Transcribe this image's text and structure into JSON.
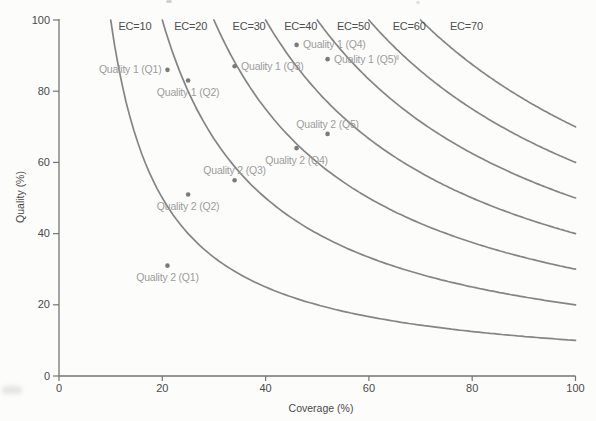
{
  "chart_data": {
    "type": "scatter",
    "title": "",
    "xlabel": "Coverage (%)",
    "ylabel": "Quality (%)",
    "xlim": [
      0,
      100
    ],
    "ylim": [
      0,
      100
    ],
    "x_ticks": [
      0,
      20,
      40,
      60,
      80,
      100
    ],
    "y_ticks": [
      0,
      20,
      40,
      60,
      80,
      100
    ],
    "grid": false,
    "legend": "none",
    "iso_curves": {
      "formula": "EC = Coverage * Quality / 100",
      "curves": [
        {
          "ec": 10,
          "label": "EC=10",
          "label_x": 11.5
        },
        {
          "ec": 20,
          "label": "EC=20",
          "label_x": 22.3
        },
        {
          "ec": 30,
          "label": "EC=30",
          "label_x": 33.6
        },
        {
          "ec": 40,
          "label": "EC=40",
          "label_x": 43.6
        },
        {
          "ec": 50,
          "label": "EC=50",
          "label_x": 53.8
        },
        {
          "ec": 60,
          "label": "EC=60",
          "label_x": 64.6
        },
        {
          "ec": 70,
          "label": "EC=70",
          "label_x": 75.7
        }
      ]
    },
    "series": [
      {
        "name": "Quality 1",
        "points": [
          {
            "label": "Quality 1 (Q1)",
            "x": 21,
            "y": 86,
            "label_anchor": "left"
          },
          {
            "label": "Quality 1 (Q2)",
            "x": 25,
            "y": 83,
            "label_anchor": "below"
          },
          {
            "label": "Quality 1 (Q3)",
            "x": 34,
            "y": 87,
            "label_anchor": "right"
          },
          {
            "label": "Quality 1 (Q4)",
            "x": 46,
            "y": 93,
            "label_anchor": "right"
          },
          {
            "label": "Quality 1 (Q5)",
            "x": 52,
            "y": 89,
            "label_anchor": "right"
          }
        ]
      },
      {
        "name": "Quality 2",
        "points": [
          {
            "label": "Quality 2 (Q1)",
            "x": 21,
            "y": 31,
            "label_anchor": "below"
          },
          {
            "label": "Quality 2 (Q2)",
            "x": 25,
            "y": 51,
            "label_anchor": "below"
          },
          {
            "label": "Quality 2 (Q3)",
            "x": 34,
            "y": 55,
            "label_anchor": "above"
          },
          {
            "label": "Quality 2 (Q4)",
            "x": 46,
            "y": 64,
            "label_anchor": "below"
          },
          {
            "label": "Quality 2 (Q5)",
            "x": 52,
            "y": 68,
            "label_anchor": "above"
          }
        ]
      }
    ],
    "colors": {
      "background": "#fcfcfb",
      "curve": "#858585",
      "axis": "#757575",
      "axis_text": "#4a4a4a",
      "ec_label_text": "#4d4d4d",
      "point": "#7b7b7b",
      "point_label_text": "#9c9c9c"
    }
  }
}
